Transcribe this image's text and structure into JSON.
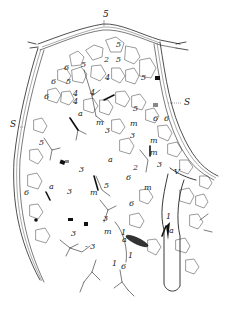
{
  "figure": {
    "background": "#ffffff",
    "ink_color": "#222222",
    "labels": [
      {
        "id": "s-top",
        "text": "5",
        "x": 103,
        "y": 17
      },
      {
        "id": "s-right",
        "text": "S",
        "x": 184,
        "y": 105
      },
      {
        "id": "s-left",
        "text": "S",
        "x": 10,
        "y": 127
      },
      {
        "id": "l-5a",
        "text": "5",
        "x": 81,
        "y": 67
      },
      {
        "id": "l-5b",
        "text": "5",
        "x": 116,
        "y": 47
      },
      {
        "id": "l-5c",
        "text": "5",
        "x": 116,
        "y": 62
      },
      {
        "id": "l-2",
        "text": "2",
        "x": 104,
        "y": 62
      },
      {
        "id": "l-4a",
        "text": "4",
        "x": 105,
        "y": 80
      },
      {
        "id": "l-5d",
        "text": "5",
        "x": 141,
        "y": 80
      },
      {
        "id": "l-6a",
        "text": "6",
        "x": 64,
        "y": 70
      },
      {
        "id": "l-6b",
        "text": "6",
        "x": 51,
        "y": 84
      },
      {
        "id": "l-5e",
        "text": "5",
        "x": 66,
        "y": 84
      },
      {
        "id": "l-4b",
        "text": "4",
        "x": 73,
        "y": 96
      },
      {
        "id": "l-4c",
        "text": "4",
        "x": 90,
        "y": 95
      },
      {
        "id": "l-6c",
        "text": "6",
        "x": 44,
        "y": 99
      },
      {
        "id": "l-4d",
        "text": "4",
        "x": 73,
        "y": 104
      },
      {
        "id": "l-a1",
        "text": "a",
        "x": 78,
        "y": 116
      },
      {
        "id": "l-m1",
        "text": "m",
        "x": 96,
        "y": 125
      },
      {
        "id": "l-3a",
        "text": "3",
        "x": 105,
        "y": 133
      },
      {
        "id": "l-5f",
        "text": "5",
        "x": 133,
        "y": 111
      },
      {
        "id": "l-m2",
        "text": "m",
        "x": 130,
        "y": 126
      },
      {
        "id": "l-3b",
        "text": "3",
        "x": 130,
        "y": 138
      },
      {
        "id": "l-6d",
        "text": "6",
        "x": 153,
        "y": 121
      },
      {
        "id": "l-6e",
        "text": "6",
        "x": 164,
        "y": 121
      },
      {
        "id": "l-m3",
        "text": "m",
        "x": 150,
        "y": 143
      },
      {
        "id": "l-m4",
        "text": "m",
        "x": 150,
        "y": 155
      },
      {
        "id": "l-3c",
        "text": "3",
        "x": 157,
        "y": 167
      },
      {
        "id": "l-5g",
        "text": "5",
        "x": 39,
        "y": 145
      },
      {
        "id": "l-a2",
        "text": "a",
        "x": 108,
        "y": 162
      },
      {
        "id": "l-2b",
        "text": "2",
        "x": 133,
        "y": 170
      },
      {
        "id": "l-3d",
        "text": "3",
        "x": 79,
        "y": 172
      },
      {
        "id": "l-6f",
        "text": "6",
        "x": 126,
        "y": 180
      },
      {
        "id": "l-V",
        "text": "V",
        "x": 174,
        "y": 174
      },
      {
        "id": "l-6g",
        "text": "6",
        "x": 24,
        "y": 195
      },
      {
        "id": "l-a3",
        "text": "a",
        "x": 49,
        "y": 189
      },
      {
        "id": "l-3e",
        "text": "3",
        "x": 67,
        "y": 194
      },
      {
        "id": "l-5h",
        "text": "5",
        "x": 104,
        "y": 188
      },
      {
        "id": "l-m5",
        "text": "m",
        "x": 90,
        "y": 195
      },
      {
        "id": "l-m6",
        "text": "m",
        "x": 144,
        "y": 190
      },
      {
        "id": "l-6h",
        "text": "6",
        "x": 129,
        "y": 206
      },
      {
        "id": "l-3f",
        "text": "3",
        "x": 103,
        "y": 221
      },
      {
        "id": "l-m7",
        "text": "m",
        "x": 104,
        "y": 234
      },
      {
        "id": "l-3g",
        "text": "3",
        "x": 71,
        "y": 236
      },
      {
        "id": "l-3h",
        "text": "- 3",
        "x": 85,
        "y": 249
      },
      {
        "id": "l-1a",
        "text": "1",
        "x": 121,
        "y": 235
      },
      {
        "id": "l-a4",
        "text": "a",
        "x": 122,
        "y": 242
      },
      {
        "id": "l-1b",
        "text": "1",
        "x": 128,
        "y": 258
      },
      {
        "id": "l-1c",
        "text": "1",
        "x": 166,
        "y": 219
      },
      {
        "id": "l-a5",
        "text": "a",
        "x": 169,
        "y": 233
      },
      {
        "id": "l-1d",
        "text": "1",
        "x": 112,
        "y": 266
      },
      {
        "id": "l-6i",
        "text": "6",
        "x": 121,
        "y": 269
      }
    ]
  }
}
